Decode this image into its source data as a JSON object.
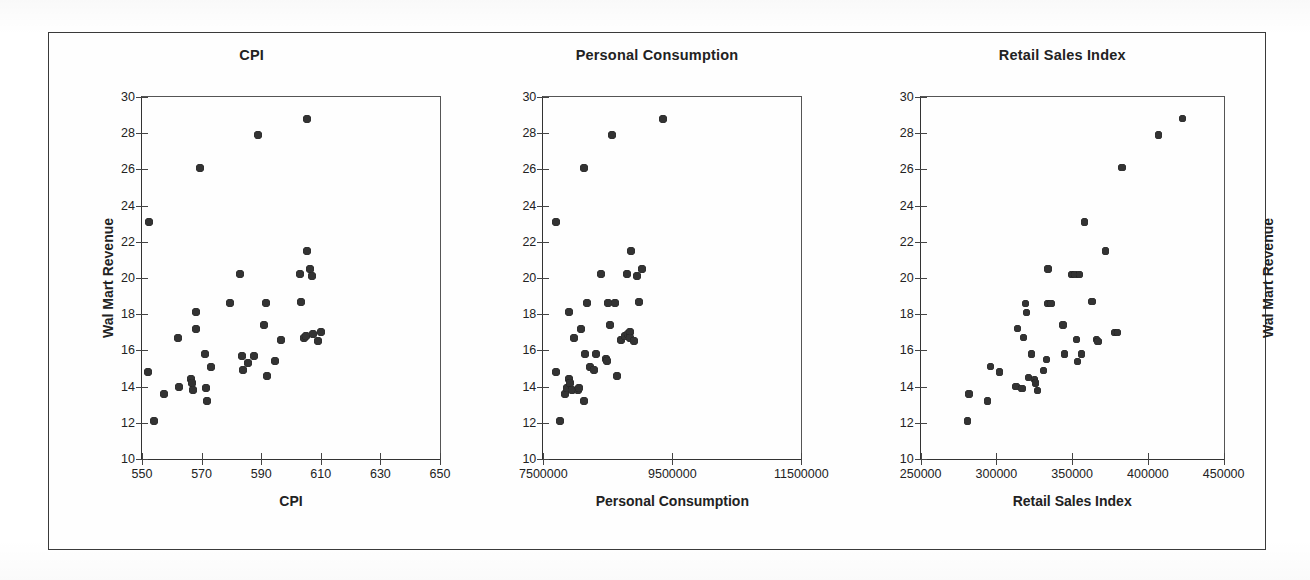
{
  "figure": {
    "border_color": "#3a3a3a",
    "background": "#ffffff",
    "marker_color": "#333333"
  },
  "chart_data": [
    {
      "type": "scatter",
      "title": "CPI",
      "xlabel": "CPI",
      "ylabel": "Wal Mart Revenue",
      "xlim": [
        550,
        650
      ],
      "ylim": [
        10,
        30
      ],
      "xticks": [
        550,
        570,
        590,
        610,
        630,
        650
      ],
      "yticks": [
        10,
        12,
        14,
        16,
        18,
        20,
        22,
        24,
        26,
        28,
        30
      ],
      "grid": false,
      "legend": "none",
      "points": [
        {
          "x": 552.5,
          "y": 23.1
        },
        {
          "x": 552.0,
          "y": 14.8
        },
        {
          "x": 554.0,
          "y": 12.1
        },
        {
          "x": 557.5,
          "y": 13.6
        },
        {
          "x": 562.0,
          "y": 16.7
        },
        {
          "x": 562.5,
          "y": 14.0
        },
        {
          "x": 566.5,
          "y": 14.4
        },
        {
          "x": 566.8,
          "y": 14.2
        },
        {
          "x": 567.0,
          "y": 13.8
        },
        {
          "x": 568.0,
          "y": 18.1
        },
        {
          "x": 568.2,
          "y": 17.2
        },
        {
          "x": 569.5,
          "y": 26.1
        },
        {
          "x": 571.0,
          "y": 15.8
        },
        {
          "x": 571.5,
          "y": 13.9
        },
        {
          "x": 571.8,
          "y": 13.2
        },
        {
          "x": 573.0,
          "y": 15.1
        },
        {
          "x": 579.5,
          "y": 18.6
        },
        {
          "x": 583.0,
          "y": 20.2
        },
        {
          "x": 583.5,
          "y": 15.7
        },
        {
          "x": 584.0,
          "y": 14.9
        },
        {
          "x": 585.5,
          "y": 15.3
        },
        {
          "x": 587.5,
          "y": 15.7
        },
        {
          "x": 589.0,
          "y": 27.9
        },
        {
          "x": 591.0,
          "y": 17.4
        },
        {
          "x": 591.5,
          "y": 18.6
        },
        {
          "x": 592.0,
          "y": 14.6
        },
        {
          "x": 594.5,
          "y": 15.4
        },
        {
          "x": 596.5,
          "y": 16.6
        },
        {
          "x": 603.0,
          "y": 20.2
        },
        {
          "x": 603.5,
          "y": 18.7
        },
        {
          "x": 604.5,
          "y": 16.7
        },
        {
          "x": 605.0,
          "y": 16.8
        },
        {
          "x": 605.5,
          "y": 21.5
        },
        {
          "x": 605.5,
          "y": 28.8
        },
        {
          "x": 606.5,
          "y": 20.5
        },
        {
          "x": 607.0,
          "y": 20.1
        },
        {
          "x": 607.5,
          "y": 16.9
        },
        {
          "x": 609.0,
          "y": 16.5
        },
        {
          "x": 610.0,
          "y": 17.0
        }
      ]
    },
    {
      "type": "scatter",
      "title": "Personal Consumption",
      "xlabel": "Personal Consumption",
      "ylabel": "Wal Mart Revenue",
      "xlim": [
        7500000,
        11500000
      ],
      "ylim": [
        10,
        30
      ],
      "xticks": [
        7500000,
        9500000,
        11500000
      ],
      "yticks": [
        10,
        12,
        14,
        16,
        18,
        20,
        22,
        24,
        26,
        28,
        30
      ],
      "grid": false,
      "legend": "none",
      "points": [
        {
          "x": 7700000,
          "y": 23.1
        },
        {
          "x": 7700000,
          "y": 14.8
        },
        {
          "x": 7760000,
          "y": 12.1
        },
        {
          "x": 7830000,
          "y": 13.6
        },
        {
          "x": 7870000,
          "y": 13.9
        },
        {
          "x": 7900000,
          "y": 14.4
        },
        {
          "x": 7920000,
          "y": 14.2
        },
        {
          "x": 7950000,
          "y": 13.8
        },
        {
          "x": 7900000,
          "y": 18.1
        },
        {
          "x": 7980000,
          "y": 16.7
        },
        {
          "x": 8030000,
          "y": 13.8
        },
        {
          "x": 8060000,
          "y": 13.9
        },
        {
          "x": 8080000,
          "y": 17.2
        },
        {
          "x": 8130000,
          "y": 26.1
        },
        {
          "x": 8130000,
          "y": 13.2
        },
        {
          "x": 8150000,
          "y": 15.8
        },
        {
          "x": 8180000,
          "y": 18.6
        },
        {
          "x": 8230000,
          "y": 15.1
        },
        {
          "x": 8280000,
          "y": 14.9
        },
        {
          "x": 8320000,
          "y": 15.8
        },
        {
          "x": 8390000,
          "y": 20.2
        },
        {
          "x": 8470000,
          "y": 15.5
        },
        {
          "x": 8490000,
          "y": 15.4
        },
        {
          "x": 8500000,
          "y": 18.6
        },
        {
          "x": 8530000,
          "y": 17.4
        },
        {
          "x": 8570000,
          "y": 27.9
        },
        {
          "x": 8610000,
          "y": 18.6
        },
        {
          "x": 8640000,
          "y": 14.6
        },
        {
          "x": 8700000,
          "y": 16.6
        },
        {
          "x": 8760000,
          "y": 16.8
        },
        {
          "x": 8800000,
          "y": 20.2
        },
        {
          "x": 8820000,
          "y": 16.9
        },
        {
          "x": 8840000,
          "y": 17.0
        },
        {
          "x": 8850000,
          "y": 16.7
        },
        {
          "x": 8860000,
          "y": 21.5
        },
        {
          "x": 8900000,
          "y": 16.5
        },
        {
          "x": 8950000,
          "y": 20.1
        },
        {
          "x": 8980000,
          "y": 18.7
        },
        {
          "x": 9030000,
          "y": 20.5
        },
        {
          "x": 9350000,
          "y": 28.8
        }
      ]
    },
    {
      "type": "scatter",
      "title": "Retail Sales Index",
      "xlabel": "Retail Sales Index",
      "ylabel": "Wal Mart Revenue",
      "xlim": [
        250000,
        450000
      ],
      "ylim": [
        10,
        30
      ],
      "xticks": [
        250000,
        300000,
        350000,
        400000,
        450000
      ],
      "yticks": [
        10,
        12,
        14,
        16,
        18,
        20,
        22,
        24,
        26,
        28,
        30
      ],
      "grid": false,
      "legend": "none",
      "points": [
        {
          "x": 281000,
          "y": 12.1
        },
        {
          "x": 282000,
          "y": 13.6
        },
        {
          "x": 294000,
          "y": 13.2
        },
        {
          "x": 296000,
          "y": 15.1
        },
        {
          "x": 302000,
          "y": 14.8
        },
        {
          "x": 313000,
          "y": 14.0
        },
        {
          "x": 314000,
          "y": 17.2
        },
        {
          "x": 317000,
          "y": 13.9
        },
        {
          "x": 318000,
          "y": 16.7
        },
        {
          "x": 319000,
          "y": 18.6
        },
        {
          "x": 320000,
          "y": 18.1
        },
        {
          "x": 321000,
          "y": 14.5
        },
        {
          "x": 323000,
          "y": 15.8
        },
        {
          "x": 325000,
          "y": 14.4
        },
        {
          "x": 326000,
          "y": 14.2
        },
        {
          "x": 327000,
          "y": 13.8
        },
        {
          "x": 331000,
          "y": 14.9
        },
        {
          "x": 333000,
          "y": 15.5
        },
        {
          "x": 334000,
          "y": 18.6
        },
        {
          "x": 336000,
          "y": 18.6
        },
        {
          "x": 334000,
          "y": 20.5
        },
        {
          "x": 344000,
          "y": 17.4
        },
        {
          "x": 345000,
          "y": 15.8
        },
        {
          "x": 350000,
          "y": 20.2
        },
        {
          "x": 352000,
          "y": 20.2
        },
        {
          "x": 353000,
          "y": 16.6
        },
        {
          "x": 353500,
          "y": 15.4
        },
        {
          "x": 355000,
          "y": 20.2
        },
        {
          "x": 356000,
          "y": 15.8
        },
        {
          "x": 358000,
          "y": 23.1
        },
        {
          "x": 363000,
          "y": 18.7
        },
        {
          "x": 366000,
          "y": 16.6
        },
        {
          "x": 367000,
          "y": 16.5
        },
        {
          "x": 372000,
          "y": 21.5
        },
        {
          "x": 378000,
          "y": 17.0
        },
        {
          "x": 380000,
          "y": 17.0
        },
        {
          "x": 383000,
          "y": 26.1
        },
        {
          "x": 407000,
          "y": 27.9
        },
        {
          "x": 423000,
          "y": 28.8
        }
      ]
    }
  ]
}
